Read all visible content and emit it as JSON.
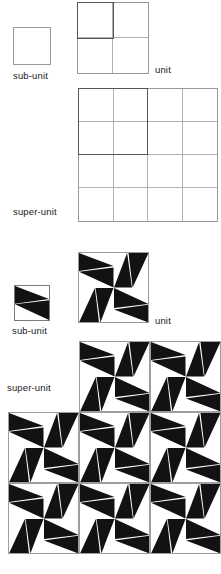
{
  "figure": {
    "title": "",
    "fill_color": "#121212",
    "background_color": "#ffffff",
    "grid_line_color": "#b0b0b0",
    "highlight_color": "#555555"
  },
  "panels": {
    "outline": {
      "sub_unit": {
        "label": "sub-unit",
        "cols": 1,
        "rows": 1
      },
      "unit": {
        "label": "unit",
        "cols": 2,
        "rows": 2,
        "highlight_cells": 1
      },
      "super_unit": {
        "label": "super-unit",
        "cols": 4,
        "rows": 4,
        "highlight_cells": 2
      }
    },
    "motif": {
      "sub_unit": {
        "label": "sub-unit",
        "cols": 1,
        "rows": 1,
        "rotations": [
          0
        ]
      },
      "unit": {
        "label": "unit",
        "cols": 2,
        "rows": 2,
        "rotations": [
          [
            0,
            270
          ],
          [
            90,
            180
          ]
        ]
      },
      "super_unit": {
        "label": "super-unit",
        "layout": "staircase",
        "unit_positions": [
          {
            "row": 0,
            "col": 1
          },
          {
            "row": 0,
            "col": 2
          },
          {
            "row": 1,
            "col": 0
          },
          {
            "row": 1,
            "col": 1
          },
          {
            "row": 1,
            "col": 2
          },
          {
            "row": 2,
            "col": 0
          },
          {
            "row": 2,
            "col": 1
          },
          {
            "row": 2,
            "col": 2
          }
        ]
      }
    }
  },
  "labels": {
    "sub_unit": "sub-unit",
    "unit": "unit",
    "super_unit": "super-unit"
  }
}
